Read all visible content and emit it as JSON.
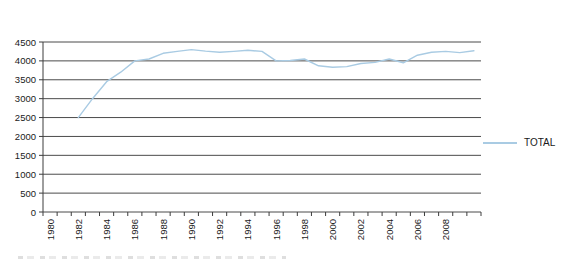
{
  "colors": {
    "line": "#a9cbe3",
    "grid": "#4b4b4b",
    "axis": "#3c3c3c",
    "text": "#1a1a1a",
    "background": "#ffffff"
  },
  "chart_data": {
    "type": "line",
    "title": "",
    "grid": "horizontal",
    "legend": {
      "position": "right",
      "entries": [
        {
          "label": "TOTAL"
        }
      ]
    },
    "y_axis": {
      "min": 0,
      "max": 4500,
      "step": 500,
      "tick_labels": [
        "0",
        "500",
        "1000",
        "1500",
        "2000",
        "2500",
        "3000",
        "3500",
        "4000",
        "4500"
      ]
    },
    "x_axis": {
      "categories": [
        1980,
        1981,
        1982,
        1983,
        1984,
        1985,
        1986,
        1987,
        1988,
        1989,
        1990,
        1991,
        1992,
        1993,
        1994,
        1995,
        1996,
        1997,
        1998,
        1999,
        2000,
        2001,
        2002,
        2003,
        2004,
        2005,
        2006,
        2007,
        2008,
        2009,
        2010
      ],
      "tick_labels": [
        "1980",
        "1982",
        "1984",
        "1986",
        "1988",
        "1990",
        "1992",
        "1994",
        "1996",
        "1998",
        "2000",
        "2002",
        "2004",
        "2006",
        "2008"
      ]
    },
    "series": [
      {
        "name": "TOTAL",
        "color": "#a9cbe3",
        "x": [
          1982,
          1983,
          1984,
          1985,
          1986,
          1987,
          1988,
          1989,
          1990,
          1991,
          1992,
          1993,
          1994,
          1995,
          1996,
          1997,
          1998,
          1999,
          2000,
          2001,
          2002,
          2003,
          2004,
          2005,
          2006,
          2007,
          2008,
          2009,
          2010
        ],
        "values": [
          2500,
          3000,
          3450,
          3700,
          4000,
          4050,
          4200,
          4250,
          4300,
          4260,
          4230,
          4250,
          4280,
          4250,
          4000,
          4010,
          4050,
          3870,
          3830,
          3850,
          3930,
          3960,
          4050,
          3950,
          4150,
          4230,
          4250,
          4220,
          4270
        ]
      }
    ]
  }
}
